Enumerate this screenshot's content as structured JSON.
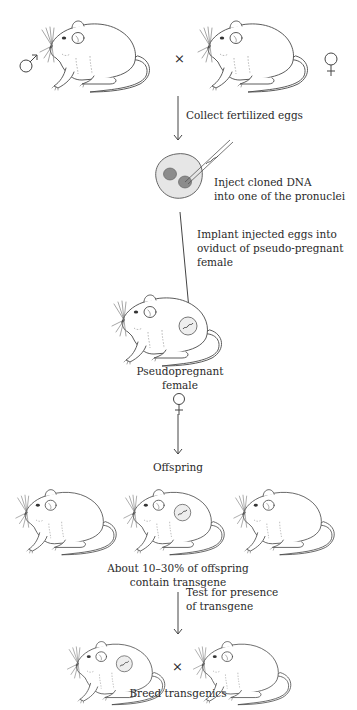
{
  "diagram": {
    "steps": {
      "parents": {
        "cross_symbol": "×",
        "male_symbol": "male-symbol",
        "female_symbol": "female-symbol"
      },
      "collect": {
        "label": "Collect fertilized eggs"
      },
      "inject": {
        "line1": "Inject cloned DNA",
        "line2": "into one of the pronuclei"
      },
      "implant": {
        "line1": "Implant injected eggs into",
        "line2": "oviduct of pseudo-pregnant",
        "line3": "female"
      },
      "pseudopregnant": {
        "line1": "Pseudopregnant",
        "line2": "female",
        "symbol": "female-symbol"
      },
      "offspring": {
        "label": "Offspring"
      },
      "percent": {
        "line1": "About 10–30% of offspring",
        "line2": "contain transgene"
      },
      "test": {
        "line1": "Test for presence",
        "line2": "of transgene"
      },
      "breed": {
        "cross_symbol": "×",
        "label": "Breed transgenics"
      }
    },
    "colors": {
      "line": "#444444",
      "egg_fill": "#e6e6e6",
      "pronucleus_fill": "#8c8c8c",
      "transgene_circle_fill": "#eeeeee"
    }
  }
}
